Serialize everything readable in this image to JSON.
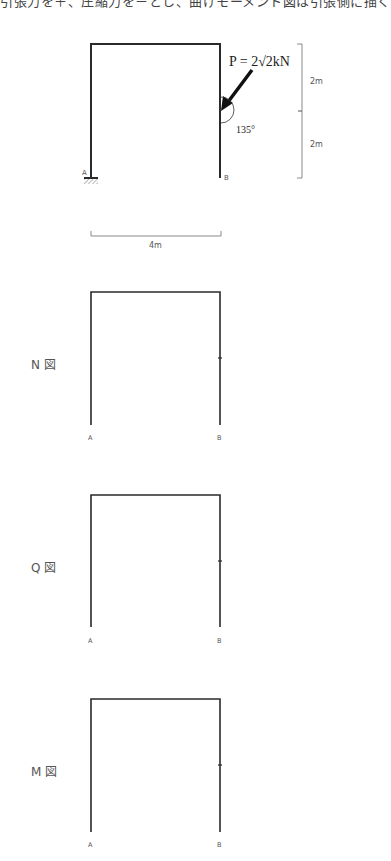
{
  "header": {
    "text": "引張力を＋、圧縮力を－とし、曲げモーメント図は引張側に描く"
  },
  "problem_frame": {
    "support_A_label": "A",
    "support_B_label": "B",
    "load_label": "P = 2√2kN",
    "angle_label": "135°",
    "dim_upper": "2m",
    "dim_lower": "2m",
    "dim_span": "4m"
  },
  "diagrams": [
    {
      "title": "N 図",
      "node_a": "A",
      "node_b": "B"
    },
    {
      "title": "Q 図",
      "node_a": "A",
      "node_b": "B"
    },
    {
      "title": "M 図",
      "node_a": "A",
      "node_b": "B"
    }
  ],
  "colors": {
    "frame": "#2a2a2a",
    "dimension": "#888888",
    "text": "#555555"
  }
}
